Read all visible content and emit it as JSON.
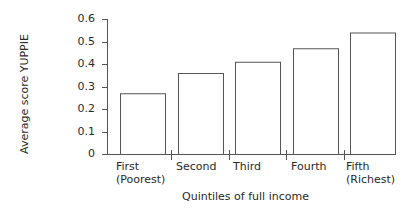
{
  "chart_data": {
    "type": "bar",
    "title": "",
    "xlabel": "Quintiles of full income",
    "ylabel": "Average score YUPPIE",
    "categories": [
      "First\n(Poorest)",
      "Second",
      "Third",
      "Fourth",
      "Fifth\n(Richest)"
    ],
    "category_lines": [
      [
        "First",
        "(Poorest)"
      ],
      [
        "Second"
      ],
      [
        "Third"
      ],
      [
        "Fourth"
      ],
      [
        "Fifth",
        "(Richest)"
      ]
    ],
    "values": [
      0.27,
      0.36,
      0.41,
      0.47,
      0.54
    ],
    "ylim": [
      0,
      0.6
    ],
    "yticks": [
      "0",
      "0.1",
      "0.2",
      "0.3",
      "0.4",
      "0.5",
      "0.6"
    ],
    "grid": false,
    "legend": null,
    "bar_fill": "#ffffff",
    "bar_stroke": "#555555"
  }
}
